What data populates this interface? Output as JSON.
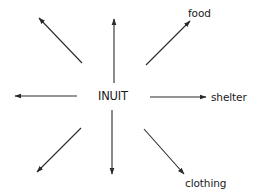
{
  "diagram": {
    "type": "radial-arrow-diagram",
    "center": {
      "label": "INUIT",
      "x": 112,
      "y": 96
    },
    "colors": {
      "stroke": "#2a2a2a",
      "text": "#1a1a1a",
      "background": "#ffffff"
    },
    "arrows": [
      {
        "id": "up",
        "direction": "up",
        "label": "",
        "x1": 114,
        "y1": 83,
        "x2": 114,
        "y2": 19
      },
      {
        "id": "upper-right",
        "direction": "upper-right",
        "label": "food",
        "x1": 146,
        "y1": 65,
        "x2": 190,
        "y2": 21
      },
      {
        "id": "right",
        "direction": "right",
        "label": "shelter",
        "x1": 150,
        "y1": 97,
        "x2": 206,
        "y2": 97
      },
      {
        "id": "lower-right",
        "direction": "lower-right",
        "label": "clothing",
        "x1": 144,
        "y1": 129,
        "x2": 184,
        "y2": 174
      },
      {
        "id": "down",
        "direction": "down",
        "label": "",
        "x1": 112,
        "y1": 110,
        "x2": 112,
        "y2": 174
      },
      {
        "id": "lower-left",
        "direction": "lower-left",
        "label": "",
        "x1": 81,
        "y1": 128,
        "x2": 37,
        "y2": 172
      },
      {
        "id": "left",
        "direction": "left",
        "label": "",
        "x1": 77,
        "y1": 96,
        "x2": 15,
        "y2": 96
      },
      {
        "id": "upper-left",
        "direction": "upper-left",
        "label": "",
        "x1": 82,
        "y1": 63,
        "x2": 39,
        "y2": 18
      }
    ],
    "labels": {
      "food": {
        "text": "food",
        "left": 188,
        "top": 7
      },
      "shelter": {
        "text": "shelter",
        "left": 211,
        "top": 91
      },
      "clothing": {
        "text": "clothing",
        "left": 185,
        "top": 177
      }
    }
  }
}
